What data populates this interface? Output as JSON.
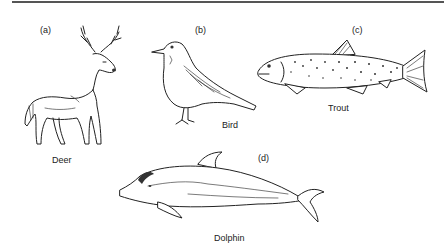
{
  "figure": {
    "panels": [
      {
        "letter": "(a)",
        "name": "Deer"
      },
      {
        "letter": "(b)",
        "name": "Bird"
      },
      {
        "letter": "(c)",
        "name": "Trout"
      },
      {
        "letter": "(d)",
        "name": "Dolphin"
      }
    ]
  }
}
